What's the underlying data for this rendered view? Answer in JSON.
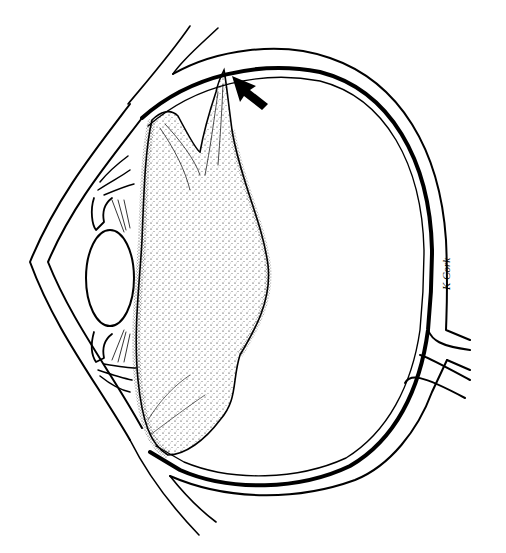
{
  "figure": {
    "type": "medical-illustration",
    "signature": "K Cork",
    "colors": {
      "ink": "#000000",
      "background": "#ffffff"
    },
    "annotations": [
      {
        "kind": "arrow",
        "points_to": "vitreous-retina-attachment",
        "position": "top"
      }
    ],
    "structures": [
      "cornea",
      "sclera",
      "retina",
      "lens",
      "iris",
      "ciliary-body",
      "vitreous-body",
      "detached-posterior-hyaloid",
      "optic-nerve",
      "eyelids"
    ]
  }
}
